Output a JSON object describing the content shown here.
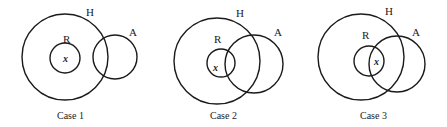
{
  "diagram": {
    "cases": [
      {
        "caption": "Case 1",
        "labels": {
          "H": "H",
          "R": "R",
          "A": "A",
          "x": "x"
        },
        "relation": "R inside H, A overlaps H, R disjoint from A, x in R"
      },
      {
        "caption": "Case 2",
        "labels": {
          "H": "H",
          "R": "R",
          "A": "A",
          "x": "x"
        },
        "relation": "R inside H, A overlaps H and R, x in R but not in A"
      },
      {
        "caption": "Case 3",
        "labels": {
          "H": "H",
          "R": "R",
          "A": "A",
          "x": "x"
        },
        "relation": "R inside H, A overlaps H and R, x in R and A"
      }
    ]
  }
}
